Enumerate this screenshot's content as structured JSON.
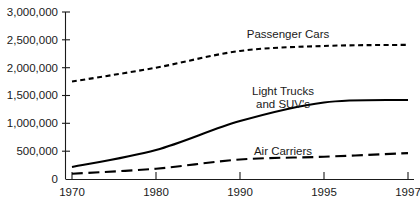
{
  "chart_data": {
    "type": "line",
    "title": "",
    "subtitle": "",
    "xlabel": "",
    "ylabel": "",
    "x": [
      1970,
      1980,
      1990,
      1995,
      1997
    ],
    "x_tick_labels": [
      "1970",
      "1980",
      "1990",
      "1995",
      "1997"
    ],
    "x_axis_scale": "categorical-evenly-spaced",
    "y_tick_labels": [
      "3,000,000",
      "2,500,000",
      "2,000,000",
      "1,500,000",
      "1,000,000",
      "500,000",
      "0"
    ],
    "y_tick_values": [
      3000000,
      2500000,
      2000000,
      1500000,
      1000000,
      500000,
      0
    ],
    "ylim": [
      0,
      3000000
    ],
    "grid": false,
    "legend_position": "inline-annotations",
    "series": [
      {
        "name": "Passenger Cars",
        "label": "Passenger Cars",
        "line_style": "short-dashed",
        "color": "#000000",
        "values": [
          1750000,
          2000000,
          2300000,
          2390000,
          2410000
        ]
      },
      {
        "name": "Light Trucks and SUV's",
        "label": "Light Trucks\nand SUV's",
        "label_line_1": "Light Trucks",
        "label_line_2": "and SUV's",
        "line_style": "solid",
        "color": "#000000",
        "values": [
          215000,
          520000,
          1040000,
          1375000,
          1420000
        ]
      },
      {
        "name": "Air Carriers",
        "label": "Air Carriers",
        "line_style": "long-dashed",
        "color": "#000000",
        "values": [
          95000,
          185000,
          350000,
          400000,
          465000
        ]
      }
    ],
    "annotations": [
      {
        "text": "Passenger Cars",
        "series": "Passenger Cars"
      },
      {
        "text": "Light Trucks",
        "series": "Light Trucks and SUV's"
      },
      {
        "text": "and SUV's",
        "series": "Light Trucks and SUV's"
      },
      {
        "text": "Air Carriers",
        "series": "Air Carriers"
      }
    ]
  },
  "axis": {
    "y_labels": [
      "3,000,000",
      "2,500,000",
      "2,000,000",
      "1,500,000",
      "1,000,000",
      "500,000",
      "0"
    ],
    "x_labels": [
      "1970",
      "1980",
      "1990",
      "1995",
      "1997"
    ]
  },
  "annotations": {
    "passenger_cars": "Passenger Cars",
    "light_trucks_line1": "Light Trucks",
    "light_trucks_line2": "and SUV's",
    "air_carriers": "Air Carriers"
  }
}
